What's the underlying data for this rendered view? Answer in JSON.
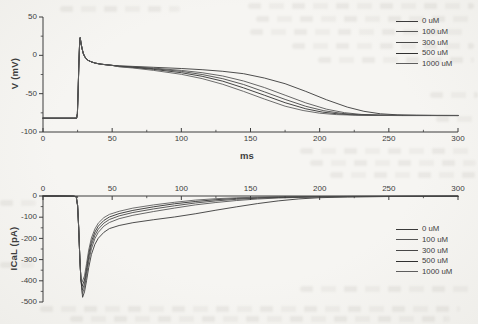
{
  "page": {
    "paper_color": "#f5f4f1",
    "ink_color": "#3d3d3d"
  },
  "chart_data": [
    {
      "type": "line",
      "title": "",
      "xlabel": "ms",
      "ylabel": "V (mV)",
      "xlim": [
        0,
        300
      ],
      "ylim": [
        -100,
        50
      ],
      "x_ticks": [
        0,
        50,
        100,
        150,
        200,
        250,
        300
      ],
      "y_ticks": [
        50,
        0,
        -50,
        -100
      ],
      "x_minor_step": 25,
      "y_minor_step": 25,
      "grid": false,
      "legend_position": "top-right",
      "x_axis_side": "bottom",
      "common_prefix_points": [
        [
          0,
          -82
        ],
        [
          12,
          -82
        ],
        [
          22,
          -82
        ],
        [
          24.3,
          -82
        ],
        [
          24.9,
          -76
        ],
        [
          25.4,
          -48
        ],
        [
          25.9,
          -14
        ],
        [
          26.4,
          12
        ],
        [
          26.9,
          23
        ],
        [
          27.4,
          17
        ],
        [
          28.2,
          9
        ],
        [
          29.2,
          2
        ],
        [
          30.5,
          -3
        ],
        [
          32.5,
          -6.5
        ],
        [
          35,
          -8.6
        ],
        [
          38,
          -10.2
        ],
        [
          42,
          -11.5
        ],
        [
          46,
          -12.4
        ],
        [
          50,
          -13.1
        ]
      ],
      "series": [
        {
          "name": "0 uM",
          "color": "#3a3a3a",
          "points": [
            [
              55,
              -13.7
            ],
            [
              65,
              -14.5
            ],
            [
              80,
              -15.6
            ],
            [
              100,
              -17.2
            ],
            [
              115,
              -18.7
            ],
            [
              130,
              -20.8
            ],
            [
              145,
              -24
            ],
            [
              160,
              -29.5
            ],
            [
              175,
              -37
            ],
            [
              190,
              -47
            ],
            [
              205,
              -58
            ],
            [
              220,
              -67.5
            ],
            [
              232,
              -73
            ],
            [
              244,
              -76.2
            ],
            [
              256,
              -77.6
            ],
            [
              270,
              -78.1
            ],
            [
              285,
              -78.3
            ],
            [
              300,
              -78.3
            ]
          ]
        },
        {
          "name": "100 uM",
          "color": "#565656",
          "points": [
            [
              55,
              -14
            ],
            [
              65,
              -15
            ],
            [
              80,
              -16.6
            ],
            [
              100,
              -19.6
            ],
            [
              115,
              -22.6
            ],
            [
              130,
              -27
            ],
            [
              145,
              -33.5
            ],
            [
              160,
              -42
            ],
            [
              175,
              -52
            ],
            [
              190,
              -62
            ],
            [
              205,
              -70.2
            ],
            [
              218,
              -74.8
            ],
            [
              230,
              -77
            ],
            [
              244,
              -78
            ],
            [
              260,
              -78.3
            ],
            [
              280,
              -78.4
            ],
            [
              300,
              -78.5
            ]
          ]
        },
        {
          "name": "300 uM",
          "color": "#474747",
          "points": [
            [
              55,
              -14.3
            ],
            [
              65,
              -15.4
            ],
            [
              80,
              -17.4
            ],
            [
              100,
              -21
            ],
            [
              115,
              -25
            ],
            [
              130,
              -30.5
            ],
            [
              145,
              -38
            ],
            [
              160,
              -47.5
            ],
            [
              175,
              -57.5
            ],
            [
              190,
              -66.5
            ],
            [
              203,
              -72.2
            ],
            [
              216,
              -75.8
            ],
            [
              228,
              -77.4
            ],
            [
              242,
              -78.1
            ],
            [
              260,
              -78.4
            ],
            [
              280,
              -78.5
            ],
            [
              300,
              -78.5
            ]
          ]
        },
        {
          "name": "500 uM",
          "color": "#303030",
          "points": [
            [
              55,
              -14.6
            ],
            [
              65,
              -15.9
            ],
            [
              80,
              -18.4
            ],
            [
              100,
              -22.7
            ],
            [
              115,
              -27.3
            ],
            [
              130,
              -33.8
            ],
            [
              145,
              -42.5
            ],
            [
              160,
              -52
            ],
            [
              175,
              -61.8
            ],
            [
              190,
              -69.8
            ],
            [
              202,
              -74
            ],
            [
              214,
              -76.5
            ],
            [
              226,
              -77.8
            ],
            [
              240,
              -78.2
            ],
            [
              260,
              -78.5
            ],
            [
              280,
              -78.5
            ],
            [
              300,
              -78.6
            ]
          ]
        },
        {
          "name": "1000 uM",
          "color": "#5e5e5e",
          "points": [
            [
              55,
              -15
            ],
            [
              65,
              -16.5
            ],
            [
              80,
              -19.6
            ],
            [
              100,
              -24.8
            ],
            [
              115,
              -30.3
            ],
            [
              130,
              -37.8
            ],
            [
              145,
              -47
            ],
            [
              160,
              -57
            ],
            [
              175,
              -66.3
            ],
            [
              188,
              -72
            ],
            [
              200,
              -75.5
            ],
            [
              212,
              -77.3
            ],
            [
              224,
              -78
            ],
            [
              240,
              -78.4
            ],
            [
              260,
              -78.6
            ],
            [
              280,
              -78.6
            ],
            [
              300,
              -78.6
            ]
          ]
        }
      ]
    },
    {
      "type": "line",
      "title": "",
      "xlabel": "",
      "ylabel": "ICaL (pA)",
      "xlim": [
        0,
        300
      ],
      "ylim": [
        -500,
        0
      ],
      "x_ticks": [
        0,
        50,
        100,
        150,
        200,
        250,
        300
      ],
      "y_ticks": [
        0,
        -100,
        -200,
        -300,
        -400,
        -500
      ],
      "x_minor_step": 25,
      "y_minor_step": 50,
      "grid": false,
      "legend_position": "middle-right",
      "x_axis_side": "top",
      "common_prefix_points": [
        [
          0,
          0
        ],
        [
          12,
          0
        ],
        [
          22,
          -1
        ],
        [
          24,
          -3
        ],
        [
          25,
          -45
        ],
        [
          25.8,
          -150
        ],
        [
          26.6,
          -290
        ],
        [
          27.4,
          -392
        ]
      ],
      "series": [
        {
          "name": "0 uM",
          "color": "#3a3a3a",
          "points": [
            [
              28.6,
              -478
            ],
            [
              30,
              -452
            ],
            [
              31.5,
              -398
            ],
            [
              33,
              -338
            ],
            [
              35,
              -276
            ],
            [
              37.5,
              -228
            ],
            [
              40,
              -199
            ],
            [
              44,
              -171
            ],
            [
              48,
              -154
            ],
            [
              55,
              -139
            ],
            [
              65,
              -126
            ],
            [
              80,
              -112
            ],
            [
              95,
              -99
            ],
            [
              110,
              -84
            ],
            [
              125,
              -67
            ],
            [
              140,
              -51
            ],
            [
              155,
              -36
            ],
            [
              170,
              -23
            ],
            [
              185,
              -13.5
            ],
            [
              200,
              -8
            ],
            [
              220,
              -4.5
            ],
            [
              250,
              -2.5
            ],
            [
              300,
              -1.5
            ]
          ]
        },
        {
          "name": "100 uM",
          "color": "#565656",
          "points": [
            [
              28.5,
              -461
            ],
            [
              30,
              -431
            ],
            [
              31.5,
              -374
            ],
            [
              33,
              -311
            ],
            [
              35,
              -249
            ],
            [
              37.5,
              -201
            ],
            [
              40,
              -171
            ],
            [
              44,
              -142
            ],
            [
              48,
              -125
            ],
            [
              55,
              -107
            ],
            [
              65,
              -91
            ],
            [
              80,
              -73
            ],
            [
              95,
              -57
            ],
            [
              110,
              -42
            ],
            [
              125,
              -30.5
            ],
            [
              140,
              -21
            ],
            [
              155,
              -14
            ],
            [
              170,
              -9.5
            ],
            [
              185,
              -6.5
            ],
            [
              200,
              -4.5
            ],
            [
              230,
              -3
            ],
            [
              265,
              -2
            ],
            [
              300,
              -1.5
            ]
          ]
        },
        {
          "name": "300 uM",
          "color": "#474747",
          "points": [
            [
              28.4,
              -444
            ],
            [
              30,
              -414
            ],
            [
              31.5,
              -355
            ],
            [
              33,
              -291
            ],
            [
              35,
              -231
            ],
            [
              37.5,
              -185
            ],
            [
              40,
              -156
            ],
            [
              44,
              -128
            ],
            [
              48,
              -111
            ],
            [
              55,
              -94
            ],
            [
              65,
              -78
            ],
            [
              80,
              -61
            ],
            [
              95,
              -46
            ],
            [
              110,
              -33
            ],
            [
              125,
              -23
            ],
            [
              140,
              -15.5
            ],
            [
              155,
              -10.5
            ],
            [
              170,
              -7
            ],
            [
              185,
              -5
            ],
            [
              200,
              -3.5
            ],
            [
              230,
              -2.5
            ],
            [
              265,
              -1.8
            ],
            [
              300,
              -1.2
            ]
          ]
        },
        {
          "name": "500 uM",
          "color": "#303030",
          "points": [
            [
              28.3,
              -426
            ],
            [
              30,
              -396
            ],
            [
              31.5,
              -337
            ],
            [
              33,
              -273
            ],
            [
              35,
              -215
            ],
            [
              37.5,
              -170
            ],
            [
              40,
              -142
            ],
            [
              44,
              -115
            ],
            [
              48,
              -99
            ],
            [
              55,
              -83
            ],
            [
              65,
              -68
            ],
            [
              80,
              -51
            ],
            [
              95,
              -37
            ],
            [
              110,
              -26
            ],
            [
              125,
              -17.5
            ],
            [
              140,
              -11.5
            ],
            [
              155,
              -8
            ],
            [
              170,
              -5.5
            ],
            [
              185,
              -4
            ],
            [
              200,
              -3
            ],
            [
              230,
              -2
            ],
            [
              265,
              -1.5
            ],
            [
              300,
              -1
            ]
          ]
        },
        {
          "name": "1000 uM",
          "color": "#5e5e5e",
          "points": [
            [
              28.2,
              -407
            ],
            [
              30,
              -377
            ],
            [
              31.5,
              -318
            ],
            [
              33,
              -255
            ],
            [
              35,
              -198
            ],
            [
              37.5,
              -155
            ],
            [
              40,
              -128
            ],
            [
              44,
              -102
            ],
            [
              48,
              -87
            ],
            [
              55,
              -72
            ],
            [
              65,
              -57
            ],
            [
              80,
              -42
            ],
            [
              95,
              -29.5
            ],
            [
              110,
              -19.5
            ],
            [
              125,
              -12.8
            ],
            [
              140,
              -8.5
            ],
            [
              155,
              -5.8
            ],
            [
              170,
              -4
            ],
            [
              185,
              -3
            ],
            [
              200,
              -2.2
            ],
            [
              230,
              -1.5
            ],
            [
              265,
              -1
            ],
            [
              300,
              -0.8
            ]
          ]
        }
      ]
    }
  ]
}
